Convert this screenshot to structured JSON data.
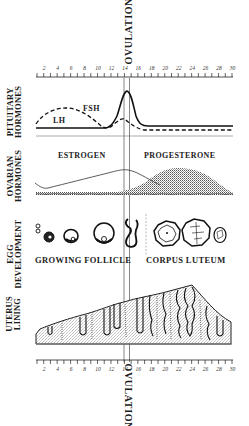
{
  "ovulation": {
    "top_label": "OVULATION",
    "bottom_label": "OVULATION",
    "day": 14
  },
  "axis": {
    "days_min": 1,
    "days_max": 30,
    "tick_labels": [
      "2",
      "4",
      "6",
      "8",
      "10",
      "12",
      "14",
      "16",
      "18",
      "20",
      "22",
      "24",
      "26",
      "28",
      "30"
    ]
  },
  "rows": {
    "pituitary": {
      "label_line1": "PITUITARY",
      "label_line2": "HORMONES",
      "fsh_label": "FSH",
      "lh_label": "LH"
    },
    "ovarian": {
      "label_line1": "OVARIAN",
      "label_line2": "HORMONES",
      "estrogen_label": "ESTROGEN",
      "progesterone_label": "PROGESTERONE"
    },
    "egg": {
      "label_line1": "EGG",
      "label_line2": "DEVELOPMENT",
      "growing_label": "GROWING FOLLICLE",
      "corpus_label": "CORPUS LUTEUM"
    },
    "uterus": {
      "label_line1": "UTERUS",
      "label_line2": "LINING"
    }
  },
  "colors": {
    "ink": "#1a1a1a",
    "stipple": "#8a8a8a",
    "background": "#ffffff"
  }
}
